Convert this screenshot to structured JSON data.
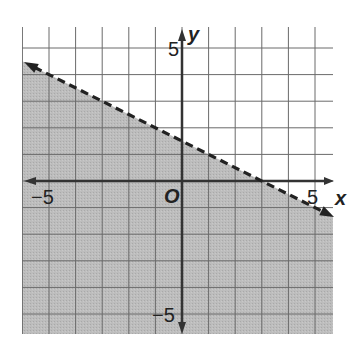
{
  "chart_data": {
    "type": "inequality-graph",
    "title": "",
    "xlabel": "x",
    "ylabel": "y",
    "xlim": [
      -6,
      5.6
    ],
    "ylim": [
      -6.5,
      6
    ],
    "grid": true,
    "tick_labels": {
      "x": [
        {
          "value": -5,
          "label": "−5"
        },
        {
          "value": 5,
          "label": "5"
        }
      ],
      "y": [
        {
          "value": 5,
          "label": "5"
        },
        {
          "value": -5,
          "label": "−5"
        }
      ],
      "origin": "O"
    },
    "boundary_line": {
      "equation": "y = -0.5x + 1.5",
      "slope": -0.5,
      "intercept": 1.5,
      "style": "dashed",
      "points": [
        [
          -6,
          4.5
        ],
        [
          0,
          1.5
        ],
        [
          3,
          0
        ],
        [
          5.6,
          -1.3
        ]
      ],
      "arrows": "both"
    },
    "shaded_region": "below",
    "inequality": "y < -1/2 x + 3/2",
    "colors": {
      "shade": "#b9b9b9",
      "grid": "#555555",
      "axis": "#333333",
      "line": "#222222"
    }
  }
}
